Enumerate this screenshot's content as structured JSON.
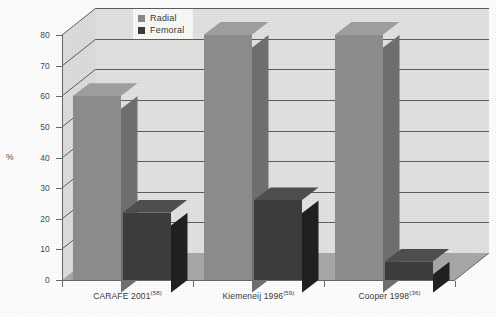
{
  "chart_data": {
    "type": "bar",
    "title": "",
    "subtitle": "",
    "xlabel": "",
    "ylabel": "%",
    "ylim": [
      0,
      80
    ],
    "yticks": [
      0,
      10,
      20,
      30,
      40,
      50,
      60,
      70,
      80
    ],
    "ytick_labels": [
      "0",
      "10",
      "20",
      "30",
      "40",
      "50",
      "60",
      "70",
      "80"
    ],
    "grid": true,
    "grid_axis": "y",
    "legend_position": "top-center",
    "style": "3d-bar",
    "categories": [
      "CARAFE 2001",
      "Kiemeneij 1996",
      "Cooper 1998"
    ],
    "category_superscripts": [
      "(58)",
      "(59)",
      "(36)"
    ],
    "category_labels": [
      {
        "name": "CARAFE 2001",
        "ref": "(58)"
      },
      {
        "name": "Kiemeneij 1996",
        "ref": "(59)"
      },
      {
        "name": "Cooper 1998",
        "ref": "(36)"
      }
    ],
    "series": [
      {
        "name": "Radial",
        "color": "#8b8b8a",
        "values": [
          60,
          80,
          80
        ]
      },
      {
        "name": "Femoral",
        "color": "#3c3c3b",
        "values": [
          22,
          26,
          6
        ]
      }
    ]
  },
  "legend": {
    "items": [
      {
        "label": "Radial",
        "color": "#8b8b8a"
      },
      {
        "label": "Femoral",
        "color": "#3c3c3b"
      }
    ]
  },
  "axes": {
    "y_title": "%",
    "y_tick_labels": [
      "80",
      "70",
      "60",
      "50",
      "40",
      "30",
      "20",
      "10",
      "0"
    ],
    "x_tick_labels": [
      "CARAFE 2001",
      "Kiemeneij 1996",
      "Cooper 1998"
    ],
    "x_tick_refs": [
      "(58)",
      "(59)",
      "(36)"
    ]
  },
  "colors": {
    "radial_face": "#8b8b8a",
    "radial_top": "#9d9d9c",
    "radial_side": "#6e6e6d",
    "femoral_face": "#3c3c3b",
    "femoral_top": "#4e4e4d",
    "femoral_side": "#202020",
    "back_wall": "#e3e3e2",
    "left_wall": "#dededd",
    "floor": "#a9a9a8",
    "gridline": "#5d5d5c",
    "axis": "#6a6a69",
    "text": "#3c3c3b"
  }
}
